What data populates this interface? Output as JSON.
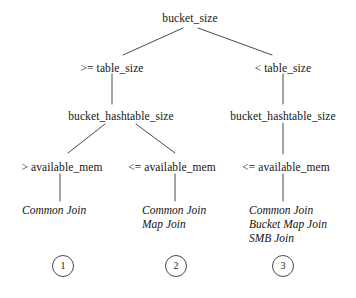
{
  "diagram": {
    "type": "decision-tree",
    "title": "",
    "root": {
      "label": "bucket_size",
      "x": 190,
      "y": 12
    },
    "level2": [
      {
        "label": ">= table_size",
        "x": 112,
        "y": 62
      },
      {
        "label": "< table_size",
        "x": 283,
        "y": 62
      }
    ],
    "level3": [
      {
        "label": "bucket_hashtable_size",
        "x": 121,
        "y": 110
      },
      {
        "label": "bucket_hashtable_size",
        "x": 283,
        "y": 110
      }
    ],
    "level4": [
      {
        "label": "> available_mem",
        "x": 62,
        "y": 161
      },
      {
        "label": "<= available_mem",
        "x": 172,
        "y": 161
      },
      {
        "label": "<= available_mem",
        "x": 286,
        "y": 161
      }
    ],
    "leaves": [
      {
        "x": 22,
        "y": 203,
        "lines": [
          "Common Join"
        ]
      },
      {
        "x": 142,
        "y": 203,
        "lines": [
          "Common Join",
          "Map Join"
        ]
      },
      {
        "x": 249,
        "y": 203,
        "lines": [
          "Common Join",
          "Bucket Map Join",
          "SMB Join"
        ]
      }
    ],
    "badges": [
      {
        "label": "1",
        "x": 63,
        "y": 255
      },
      {
        "label": "2",
        "x": 176,
        "y": 255
      },
      {
        "label": "3",
        "x": 283,
        "y": 255
      }
    ],
    "edges": {
      "stroke_color": "#4a4a4a",
      "stroke_width": 1,
      "segments": [
        {
          "name": "root-to-left",
          "x1": 183,
          "y1": 28,
          "x2": 123,
          "y2": 55
        },
        {
          "name": "root-to-right",
          "x1": 198,
          "y1": 28,
          "x2": 272,
          "y2": 55
        },
        {
          "name": "left-cond-to-hash",
          "x1": 112,
          "y1": 74,
          "x2": 112,
          "y2": 104
        },
        {
          "name": "right-cond-to-hash",
          "x1": 283,
          "y1": 74,
          "x2": 283,
          "y2": 104
        },
        {
          "name": "lefthash-to-leftmem",
          "x1": 105,
          "y1": 124,
          "x2": 68,
          "y2": 153
        },
        {
          "name": "lefthash-to-midmem",
          "x1": 136,
          "y1": 124,
          "x2": 175,
          "y2": 153
        },
        {
          "name": "righthash-to-rightmem",
          "x1": 283,
          "y1": 123,
          "x2": 283,
          "y2": 154
        },
        {
          "name": "leftmem-to-leaf",
          "x1": 60,
          "y1": 174,
          "x2": 60,
          "y2": 201
        },
        {
          "name": "midmem-to-leaf",
          "x1": 175,
          "y1": 174,
          "x2": 175,
          "y2": 201
        },
        {
          "name": "rightmem-to-leaf",
          "x1": 283,
          "y1": 174,
          "x2": 283,
          "y2": 201
        }
      ]
    }
  }
}
